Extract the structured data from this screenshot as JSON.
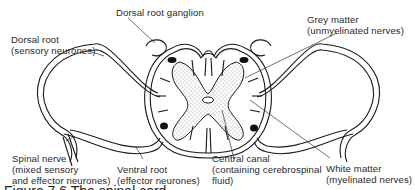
{
  "diagram": {
    "labels": {
      "dorsal_root_ganglion": "Dorsal root ganglion",
      "dorsal_root_l1": "Dorsal root",
      "dorsal_root_l2": "(sensory neurones)",
      "grey_matter_l1": "Grey matter",
      "grey_matter_l2": "(unmyelinated nerves)",
      "spinal_nerve_l1": "Spinal nerve",
      "spinal_nerve_l2": "(mixed sensory",
      "spinal_nerve_l3": "and effector neurones)",
      "ventral_root_l1": "Ventral root",
      "ventral_root_l2": "(effector neurones)",
      "central_canal_l1": "Central canal",
      "central_canal_l2": "(containing cerebrospinal",
      "central_canal_l3": "fluid)",
      "white_matter_l1": "White matter",
      "white_matter_l2": "(myelinated nerves)"
    },
    "caption": "Figure 7.6  The spinal cord",
    "colors": {
      "line": "#1a1a1a",
      "text": "#2a2a2a",
      "background": "#ffffff"
    }
  }
}
